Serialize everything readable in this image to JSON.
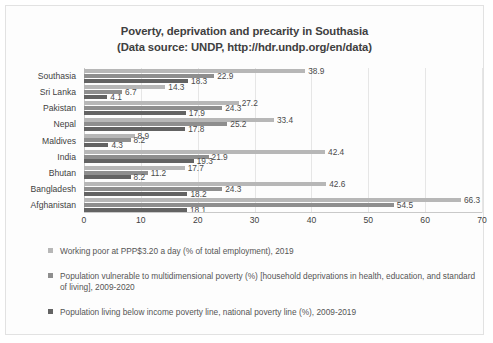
{
  "chart_data": {
    "type": "bar",
    "orientation": "horizontal",
    "title": "Poverty, deprivation and precarity in Southasia",
    "subtitle": "(Data source: UNDP, http://hdr.undp.org/en/data)",
    "xlabel": "",
    "ylabel": "",
    "xlim": [
      0,
      70
    ],
    "xticks": [
      0,
      10,
      20,
      30,
      40,
      50,
      60,
      70
    ],
    "grid": true,
    "legend_position": "bottom-left",
    "categories": [
      "Southasia",
      "Sri Lanka",
      "Pakistan",
      "Nepal",
      "Maldives",
      "India",
      "Bhutan",
      "Bangladesh",
      "Afghanistan"
    ],
    "series": [
      {
        "name": "Working poor at PPP$3.20 a day (% of total employment), 2019",
        "color": "#b7b7b7",
        "values": [
          38.9,
          14.3,
          27.2,
          33.4,
          8.9,
          42.4,
          17.7,
          42.6,
          66.3
        ]
      },
      {
        "name": "Population vulnerable to multidimensional poverty (%) [household deprivations in health, education, and standard of living], 2009-2020",
        "color": "#8e8e8e",
        "values": [
          22.9,
          6.7,
          24.3,
          25.2,
          8.2,
          21.9,
          11.2,
          24.3,
          54.5
        ]
      },
      {
        "name": "Population living below income poverty line, national poverty line (%), 2009-2019",
        "color": "#636363",
        "values": [
          18.3,
          4.1,
          17.9,
          17.8,
          4.3,
          19.3,
          8.2,
          18.2,
          18.1
        ]
      }
    ]
  },
  "legend": {
    "items": [
      "Working poor at PPP$3.20 a day (% of total employment), 2019",
      "Population vulnerable to multidimensional poverty (%) [household deprivations in health, education, and standard of living], 2009-2020",
      "Population living below income poverty line, national poverty line (%), 2009-2019"
    ]
  }
}
